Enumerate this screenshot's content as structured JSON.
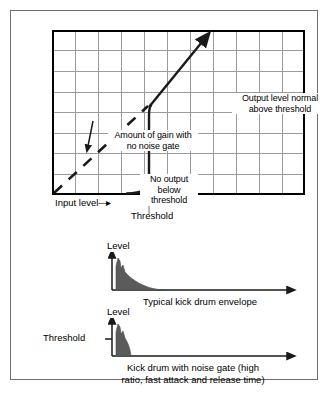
{
  "figure": {
    "border_color": "#6e6e6e",
    "background": "#ffffff"
  },
  "transfer_graph": {
    "grid": {
      "columns": 11,
      "rows": 8,
      "grid_color": "#9a9a9a",
      "border_color": "#000000"
    },
    "axis": {
      "y_label": "Output level",
      "y_label_arrow": "—▶",
      "x_label": "Input level",
      "x_label_arrow": "▶",
      "threshold_tick_label": "Threshold"
    },
    "annotations": {
      "gain": "Amount of gain with\nno noise gate",
      "no_output": "No output\nbelow\nthreshold",
      "normal": "Output level normal\nabove threshold"
    },
    "curve_color": "#1a1a1a",
    "dashed_line_color": "#1a1a1a"
  },
  "envelope_top": {
    "level_label": "Level",
    "caption": "Typical kick drum envelope",
    "fill_color": "#5b5b5b",
    "axis_color": "#1a1a1a",
    "gated": false
  },
  "envelope_bottom": {
    "level_label": "Level",
    "threshold_label": "Threshold",
    "caption": "Kick drum with noise gate (high\nratio, fast attack and release time)",
    "fill_color": "#5b5b5b",
    "axis_color": "#1a1a1a",
    "gated": true
  }
}
